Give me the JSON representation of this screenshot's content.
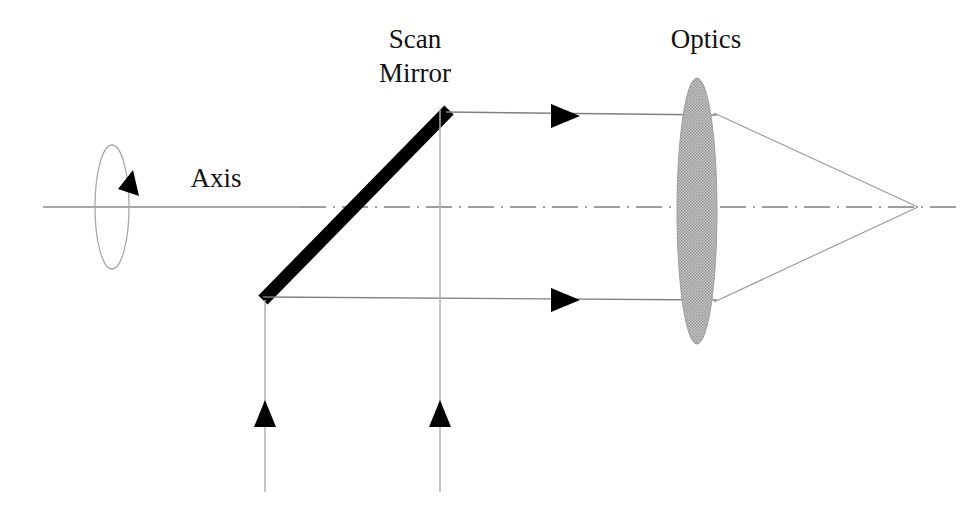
{
  "diagram": {
    "background_color": "#ffffff",
    "width": 969,
    "height": 512,
    "labels": {
      "scan_mirror_line1": "Scan",
      "scan_mirror_line2": "Mirror",
      "optics": "Optics",
      "axis": "Axis"
    },
    "colors": {
      "mirror": "#000000",
      "ray": "#808080",
      "axis": "#8a8a8a",
      "lens_fill": "#b3b3b3",
      "lens_stroke": "#9a9a9a",
      "arrowhead": "#000000",
      "text": "#111111",
      "rotation_ellipse": "#a8a8a8"
    },
    "elements": {
      "scan_mirror": {
        "name": "Scan Mirror",
        "type": "tilted-bar",
        "angle_deg": 45,
        "x1": 263,
        "y1": 300,
        "x2": 449,
        "y2": 110,
        "thickness": 13
      },
      "optics_lens": {
        "name": "Optics",
        "type": "lens-ellipse",
        "center_x": 697,
        "center_y": 211,
        "rx": 20,
        "ry": 133
      },
      "optical_axis": {
        "name": "Axis",
        "type": "dash-dot-line",
        "y": 207,
        "x_start": 43,
        "x_end": 960
      },
      "rotation_indicator": {
        "name": "rotation ellipse about axis",
        "center_x": 112,
        "center_y": 207,
        "rx": 17,
        "ry": 62
      },
      "focal_point": {
        "x": 918,
        "y": 207
      },
      "upper_ray": {
        "y": 115,
        "x_start": 449,
        "x_end": 717
      },
      "lower_ray": {
        "y": 300,
        "x_start": 263,
        "x_end": 717
      },
      "scan_arrow_left": {
        "x": 265,
        "y_top": 300,
        "y_bottom": 492,
        "arrow_y": 414
      },
      "scan_arrow_right": {
        "x": 440,
        "y_top": 110,
        "y_bottom": 492,
        "arrow_y": 414
      }
    },
    "label_positions": {
      "scan_mirror": {
        "x": 415,
        "y_line1": 48,
        "y_line2": 82
      },
      "optics": {
        "x": 706,
        "y": 48
      },
      "axis": {
        "x": 216,
        "y": 187
      }
    }
  }
}
